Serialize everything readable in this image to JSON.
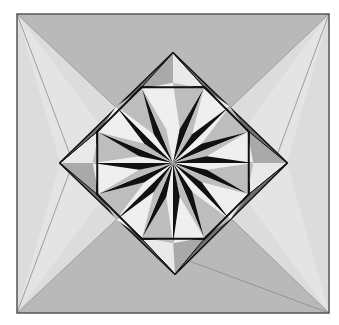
{
  "diagram": {
    "type": "geometric-fold-pattern",
    "square": {
      "x": 17,
      "y": 14,
      "w": 312,
      "h": 299
    },
    "center": [
      173,
      163
    ],
    "diamond": {
      "top": [
        173,
        53
      ],
      "right": [
        287,
        163
      ],
      "bottom": [
        175,
        274
      ],
      "left": [
        60,
        163
      ]
    },
    "octagon_radius": 82,
    "star_points": 16,
    "colors": {
      "background": "#ffffff",
      "frame": "#555555",
      "region_dark": "#b9b9b9",
      "region_light": "#dcdcdc",
      "region_lighter": "#e4e4e4",
      "flap_dark": "#6e6e6e",
      "flap_mid": "#a9a9a9",
      "flap_light": "#e9e9e9",
      "star_black": "#111111",
      "star_gray": "#bdbdbd",
      "star_white": "#efefef",
      "line": "#8a8a8a"
    }
  }
}
